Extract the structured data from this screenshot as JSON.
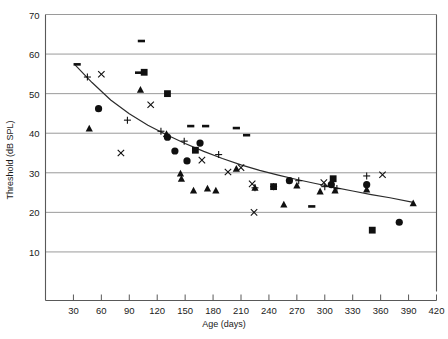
{
  "chart_data": {
    "type": "scatter",
    "title": "",
    "xlabel": "Age (days)",
    "ylabel": "Threshold (dB SPL)",
    "xlim": [
      0,
      420
    ],
    "ylim": [
      0,
      70
    ],
    "xticks": [
      30,
      60,
      90,
      120,
      150,
      180,
      210,
      240,
      270,
      300,
      330,
      360,
      390,
      420
    ],
    "yticks": [
      0,
      10,
      20,
      30,
      40,
      50,
      60,
      70
    ],
    "ytick_labels": [
      "",
      "10",
      "20",
      "30",
      "40",
      "50",
      "60",
      "70"
    ],
    "grid": "horizontal",
    "legend": "none",
    "series": [
      {
        "name": "dash",
        "marker": "dash",
        "points": [
          {
            "x": 34,
            "y": 57.4
          },
          {
            "x": 103,
            "y": 63.3
          },
          {
            "x": 100,
            "y": 55.3
          },
          {
            "x": 156,
            "y": 41.8
          },
          {
            "x": 172,
            "y": 41.8
          },
          {
            "x": 205,
            "y": 41.3
          },
          {
            "x": 216,
            "y": 39.5
          },
          {
            "x": 286,
            "y": 21.5
          }
        ]
      },
      {
        "name": "plus",
        "marker": "plus",
        "points": [
          {
            "x": 45,
            "y": 54.2
          },
          {
            "x": 88,
            "y": 43.3
          },
          {
            "x": 124,
            "y": 40.5
          },
          {
            "x": 149,
            "y": 38.0
          },
          {
            "x": 186,
            "y": 34.6
          },
          {
            "x": 225,
            "y": 26.2
          },
          {
            "x": 245,
            "y": 26.5
          },
          {
            "x": 272,
            "y": 28.0
          },
          {
            "x": 300,
            "y": 26.5
          },
          {
            "x": 313,
            "y": 26.0
          },
          {
            "x": 345,
            "y": 29.2
          }
        ]
      },
      {
        "name": "cross",
        "marker": "cross",
        "points": [
          {
            "x": 60,
            "y": 54.9
          },
          {
            "x": 81,
            "y": 35.0
          },
          {
            "x": 113,
            "y": 47.2
          },
          {
            "x": 168,
            "y": 33.2
          },
          {
            "x": 196,
            "y": 30.2
          },
          {
            "x": 210,
            "y": 31.3
          },
          {
            "x": 222,
            "y": 27.2
          },
          {
            "x": 224,
            "y": 20.0
          },
          {
            "x": 299,
            "y": 27.5
          },
          {
            "x": 362,
            "y": 29.5
          }
        ]
      },
      {
        "name": "circle",
        "marker": "circle",
        "points": [
          {
            "x": 57,
            "y": 46.2
          },
          {
            "x": 131,
            "y": 39.0
          },
          {
            "x": 139,
            "y": 35.5
          },
          {
            "x": 152,
            "y": 33.0
          },
          {
            "x": 166,
            "y": 37.5
          },
          {
            "x": 262,
            "y": 28.0
          },
          {
            "x": 307,
            "y": 27.0
          },
          {
            "x": 345,
            "y": 27.0
          },
          {
            "x": 380,
            "y": 17.5
          }
        ]
      },
      {
        "name": "square",
        "marker": "square",
        "points": [
          {
            "x": 106,
            "y": 55.4
          },
          {
            "x": 131,
            "y": 50.0
          },
          {
            "x": 161,
            "y": 35.7
          },
          {
            "x": 245,
            "y": 26.5
          },
          {
            "x": 309,
            "y": 28.5
          },
          {
            "x": 351,
            "y": 15.5
          }
        ]
      },
      {
        "name": "triangle",
        "marker": "triangle",
        "points": [
          {
            "x": 47,
            "y": 41.2
          },
          {
            "x": 102,
            "y": 51.0
          },
          {
            "x": 130,
            "y": 39.8
          },
          {
            "x": 145,
            "y": 29.8
          },
          {
            "x": 146,
            "y": 28.5
          },
          {
            "x": 159,
            "y": 25.5
          },
          {
            "x": 174,
            "y": 26.0
          },
          {
            "x": 183,
            "y": 25.5
          },
          {
            "x": 205,
            "y": 31.0
          },
          {
            "x": 225,
            "y": 26.2
          },
          {
            "x": 256,
            "y": 22.0
          },
          {
            "x": 270,
            "y": 26.8
          },
          {
            "x": 295,
            "y": 25.3
          },
          {
            "x": 311,
            "y": 25.5
          },
          {
            "x": 345,
            "y": 25.8
          },
          {
            "x": 395,
            "y": 22.3
          }
        ]
      }
    ],
    "trend_line": {
      "name": "fitted-curve",
      "points": [
        {
          "x": 32,
          "y": 57.2
        },
        {
          "x": 50,
          "y": 52.8
        },
        {
          "x": 70,
          "y": 48.4
        },
        {
          "x": 90,
          "y": 44.9
        },
        {
          "x": 110,
          "y": 42.0
        },
        {
          "x": 130,
          "y": 39.6
        },
        {
          "x": 150,
          "y": 37.4
        },
        {
          "x": 170,
          "y": 35.4
        },
        {
          "x": 190,
          "y": 33.6
        },
        {
          "x": 210,
          "y": 32.0
        },
        {
          "x": 230,
          "y": 30.6
        },
        {
          "x": 250,
          "y": 29.4
        },
        {
          "x": 270,
          "y": 28.3
        },
        {
          "x": 290,
          "y": 27.3
        },
        {
          "x": 310,
          "y": 26.3
        },
        {
          "x": 330,
          "y": 25.4
        },
        {
          "x": 350,
          "y": 24.5
        },
        {
          "x": 370,
          "y": 23.7
        },
        {
          "x": 395,
          "y": 22.5
        }
      ]
    }
  },
  "colors": {
    "marker": "#101010",
    "grid": "#9a9a9a",
    "axis": "#595959",
    "text": "#1a1a1a",
    "curve": "#2b2b2b",
    "background": "#ffffff"
  }
}
